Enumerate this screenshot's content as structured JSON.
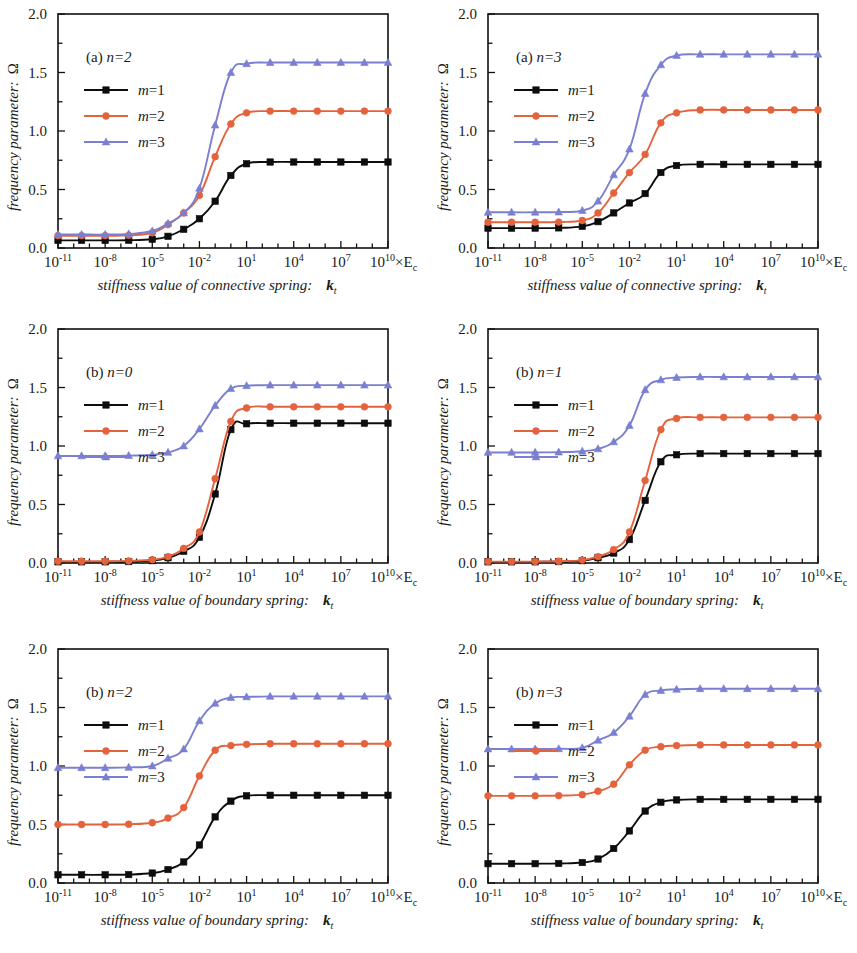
{
  "figure": {
    "background": "#ffffff",
    "panel_count": 6
  },
  "axes": {
    "ylabel": "frequency parameter:",
    "ylabel_symbol": "Ω",
    "y_ticks": [
      "0.0",
      "0.5",
      "1.0",
      "1.5",
      "2.0"
    ],
    "y_tick_values": [
      0.0,
      0.5,
      1.0,
      1.5,
      2.0
    ],
    "ylim": [
      0.0,
      2.0
    ],
    "x_ticks": [
      {
        "mantissa": "10",
        "exponent": "-11"
      },
      {
        "mantissa": "10",
        "exponent": "-8"
      },
      {
        "mantissa": "10",
        "exponent": "-5"
      },
      {
        "mantissa": "10",
        "exponent": "-2"
      },
      {
        "mantissa": "10",
        "exponent": "1"
      },
      {
        "mantissa": "10",
        "exponent": "4"
      },
      {
        "mantissa": "10",
        "exponent": "7"
      },
      {
        "mantissa": "10",
        "exponent": "10"
      }
    ],
    "x_tick_values": [
      -11,
      -8,
      -5,
      -2,
      1,
      4,
      7,
      10
    ],
    "xlim": [
      -11,
      10
    ],
    "x_unit_suffix": "×E",
    "x_unit_subscript": "c",
    "xlabel_connective": "stiffness value of connective spring:",
    "xlabel_boundary": "stiffness value of boundary spring:",
    "xlabel_symbol": "k",
    "xlabel_symbol_sub": "t",
    "grid": false
  },
  "colors": {
    "m1": "#0d0d0d",
    "m2": "#e4623c",
    "m3": "#7b7fd0",
    "frame": "#111111"
  },
  "legend": {
    "position": "upper-left",
    "entries": [
      {
        "label": "m=1",
        "color_key": "m1",
        "marker": "square"
      },
      {
        "label": "m=2",
        "color_key": "m2",
        "marker": "circle"
      },
      {
        "label": "m=3",
        "color_key": "m3",
        "marker": "triangle"
      }
    ]
  },
  "chart_data": [
    {
      "id": "panel-a-n2",
      "type": "line",
      "panel_prefix": "(a)",
      "panel_italic": "n=2",
      "title": "(a) n=2",
      "xlabel": "stiffness value of connective spring:  k_t",
      "ylabel": "frequency parameter: Ω",
      "xlabel_kind": "connective",
      "xlim": [
        -11,
        10
      ],
      "ylim": [
        0,
        2
      ],
      "x": [
        -11,
        -9.5,
        -8,
        -6.5,
        -5,
        -4,
        -3,
        -2,
        -1,
        0,
        1,
        2.5,
        4,
        5.5,
        7,
        8.5,
        10
      ],
      "series": [
        {
          "name": "m=1",
          "marker": "square",
          "color": "#0d0d0d",
          "values": [
            0.065,
            0.065,
            0.065,
            0.066,
            0.075,
            0.1,
            0.16,
            0.25,
            0.4,
            0.62,
            0.72,
            0.735,
            0.735,
            0.735,
            0.735,
            0.735,
            0.735
          ]
        },
        {
          "name": "m=2",
          "marker": "circle",
          "color": "#e4623c",
          "values": [
            0.105,
            0.105,
            0.105,
            0.108,
            0.13,
            0.2,
            0.3,
            0.45,
            0.78,
            1.06,
            1.155,
            1.17,
            1.17,
            1.17,
            1.17,
            1.17,
            1.17
          ]
        },
        {
          "name": "m=3",
          "marker": "triangle",
          "color": "#7b7fd0",
          "values": [
            0.115,
            0.115,
            0.115,
            0.12,
            0.145,
            0.21,
            0.3,
            0.51,
            1.05,
            1.5,
            1.575,
            1.585,
            1.585,
            1.585,
            1.585,
            1.585,
            1.585
          ]
        }
      ]
    },
    {
      "id": "panel-a-n3",
      "type": "line",
      "panel_prefix": "(a)",
      "panel_italic": "n=3",
      "title": "(a) n=3",
      "xlabel": "stiffness value of connective spring:  k_t",
      "ylabel": "frequency parameter: Ω",
      "xlabel_kind": "connective",
      "xlim": [
        -11,
        10
      ],
      "ylim": [
        0,
        2
      ],
      "x": [
        -11,
        -9.5,
        -8,
        -6.5,
        -5,
        -4,
        -3,
        -2,
        -1,
        0,
        1,
        2.5,
        4,
        5.5,
        7,
        8.5,
        10
      ],
      "series": [
        {
          "name": "m=1",
          "marker": "square",
          "color": "#0d0d0d",
          "values": [
            0.17,
            0.17,
            0.17,
            0.172,
            0.185,
            0.225,
            0.3,
            0.385,
            0.465,
            0.645,
            0.705,
            0.715,
            0.715,
            0.715,
            0.715,
            0.715,
            0.715
          ]
        },
        {
          "name": "m=2",
          "marker": "circle",
          "color": "#e4623c",
          "values": [
            0.22,
            0.22,
            0.22,
            0.222,
            0.235,
            0.3,
            0.47,
            0.645,
            0.8,
            1.07,
            1.155,
            1.18,
            1.18,
            1.18,
            1.18,
            1.18,
            1.18
          ]
        },
        {
          "name": "m=3",
          "marker": "triangle",
          "color": "#7b7fd0",
          "values": [
            0.305,
            0.305,
            0.305,
            0.307,
            0.32,
            0.4,
            0.625,
            0.845,
            1.32,
            1.565,
            1.645,
            1.655,
            1.655,
            1.655,
            1.655,
            1.655,
            1.655
          ]
        }
      ]
    },
    {
      "id": "panel-b-n0",
      "type": "line",
      "panel_prefix": "(b)",
      "panel_italic": "n=0",
      "title": "(b) n=0",
      "xlabel": "stiffness value of boundary spring:  k_t",
      "ylabel": "frequency parameter: Ω",
      "xlabel_kind": "boundary",
      "xlim": [
        -11,
        10
      ],
      "ylim": [
        0,
        2
      ],
      "x": [
        -11,
        -9.5,
        -8,
        -6.5,
        -5,
        -4,
        -3,
        -2,
        -1,
        0,
        1,
        2.5,
        4,
        5.5,
        7,
        8.5,
        10
      ],
      "series": [
        {
          "name": "m=1",
          "marker": "square",
          "color": "#0d0d0d",
          "values": [
            0.01,
            0.01,
            0.01,
            0.012,
            0.02,
            0.045,
            0.1,
            0.22,
            0.59,
            1.14,
            1.19,
            1.195,
            1.195,
            1.195,
            1.195,
            1.195,
            1.195
          ]
        },
        {
          "name": "m=2",
          "marker": "circle",
          "color": "#e4623c",
          "values": [
            0.015,
            0.015,
            0.015,
            0.018,
            0.028,
            0.055,
            0.125,
            0.265,
            0.72,
            1.21,
            1.325,
            1.335,
            1.335,
            1.335,
            1.335,
            1.335,
            1.335
          ]
        },
        {
          "name": "m=3",
          "marker": "triangle",
          "color": "#7b7fd0",
          "values": [
            0.915,
            0.915,
            0.915,
            0.918,
            0.925,
            0.945,
            1.0,
            1.145,
            1.345,
            1.49,
            1.515,
            1.52,
            1.52,
            1.52,
            1.52,
            1.52,
            1.52
          ]
        }
      ]
    },
    {
      "id": "panel-b-n1",
      "type": "line",
      "panel_prefix": "(b)",
      "panel_italic": "n=1",
      "title": "(b) n=1",
      "xlabel": "stiffness value of boundary spring:  k_t",
      "ylabel": "frequency parameter: Ω",
      "xlabel_kind": "boundary",
      "xlim": [
        -11,
        10
      ],
      "ylim": [
        0,
        2
      ],
      "x": [
        -11,
        -9.5,
        -8,
        -6.5,
        -5,
        -4,
        -3,
        -2,
        -1,
        0,
        1,
        2.5,
        4,
        5.5,
        7,
        8.5,
        10
      ],
      "series": [
        {
          "name": "m=1",
          "marker": "square",
          "color": "#0d0d0d",
          "values": [
            0.01,
            0.01,
            0.01,
            0.012,
            0.02,
            0.045,
            0.085,
            0.2,
            0.535,
            0.865,
            0.925,
            0.935,
            0.935,
            0.935,
            0.935,
            0.935,
            0.935
          ]
        },
        {
          "name": "m=2",
          "marker": "circle",
          "color": "#e4623c",
          "values": [
            0.012,
            0.012,
            0.012,
            0.015,
            0.025,
            0.055,
            0.115,
            0.265,
            0.705,
            1.14,
            1.235,
            1.245,
            1.245,
            1.245,
            1.245,
            1.245,
            1.245
          ]
        },
        {
          "name": "m=3",
          "marker": "triangle",
          "color": "#7b7fd0",
          "values": [
            0.945,
            0.945,
            0.945,
            0.947,
            0.955,
            0.975,
            1.035,
            1.175,
            1.48,
            1.565,
            1.585,
            1.59,
            1.59,
            1.59,
            1.59,
            1.59,
            1.59
          ]
        }
      ]
    },
    {
      "id": "panel-b-n2",
      "type": "line",
      "panel_prefix": "(b)",
      "panel_italic": "n=2",
      "title": "(b) n=2",
      "xlabel": "stiffness value of boundary spring:  k_t",
      "ylabel": "frequency parameter: Ω",
      "xlabel_kind": "boundary",
      "xlim": [
        -11,
        10
      ],
      "ylim": [
        0,
        2
      ],
      "x": [
        -11,
        -9.5,
        -8,
        -6.5,
        -5,
        -4,
        -3,
        -2,
        -1,
        0,
        1,
        2.5,
        4,
        5.5,
        7,
        8.5,
        10
      ],
      "series": [
        {
          "name": "m=1",
          "marker": "square",
          "color": "#0d0d0d",
          "values": [
            0.07,
            0.07,
            0.07,
            0.072,
            0.085,
            0.115,
            0.18,
            0.325,
            0.565,
            0.7,
            0.745,
            0.75,
            0.75,
            0.75,
            0.75,
            0.75,
            0.75
          ]
        },
        {
          "name": "m=2",
          "marker": "circle",
          "color": "#e4623c",
          "values": [
            0.5,
            0.5,
            0.5,
            0.502,
            0.515,
            0.555,
            0.645,
            0.915,
            1.135,
            1.175,
            1.185,
            1.19,
            1.19,
            1.19,
            1.19,
            1.19,
            1.19
          ]
        },
        {
          "name": "m=3",
          "marker": "triangle",
          "color": "#7b7fd0",
          "values": [
            0.985,
            0.985,
            0.985,
            0.988,
            1.0,
            1.065,
            1.145,
            1.385,
            1.535,
            1.585,
            1.59,
            1.595,
            1.595,
            1.595,
            1.595,
            1.595,
            1.595
          ]
        }
      ]
    },
    {
      "id": "panel-b-n3",
      "type": "line",
      "panel_prefix": "(b)",
      "panel_italic": "n=3",
      "title": "(b) n=3",
      "xlabel": "stiffness value of boundary spring:  k_t",
      "ylabel": "frequency parameter: Ω",
      "xlabel_kind": "boundary",
      "xlim": [
        -11,
        10
      ],
      "ylim": [
        0,
        2
      ],
      "x": [
        -11,
        -9.5,
        -8,
        -6.5,
        -5,
        -4,
        -3,
        -2,
        -1,
        0,
        1,
        2.5,
        4,
        5.5,
        7,
        8.5,
        10
      ],
      "series": [
        {
          "name": "m=1",
          "marker": "square",
          "color": "#0d0d0d",
          "values": [
            0.165,
            0.165,
            0.165,
            0.167,
            0.175,
            0.205,
            0.295,
            0.445,
            0.615,
            0.69,
            0.71,
            0.715,
            0.715,
            0.715,
            0.715,
            0.715,
            0.715
          ]
        },
        {
          "name": "m=2",
          "marker": "circle",
          "color": "#e4623c",
          "values": [
            0.745,
            0.745,
            0.745,
            0.747,
            0.755,
            0.785,
            0.845,
            1.01,
            1.135,
            1.165,
            1.175,
            1.18,
            1.18,
            1.18,
            1.18,
            1.18,
            1.18
          ]
        },
        {
          "name": "m=3",
          "marker": "triangle",
          "color": "#7b7fd0",
          "values": [
            1.145,
            1.145,
            1.145,
            1.147,
            1.155,
            1.22,
            1.285,
            1.425,
            1.61,
            1.645,
            1.655,
            1.66,
            1.66,
            1.66,
            1.66,
            1.66,
            1.66
          ]
        }
      ]
    }
  ]
}
